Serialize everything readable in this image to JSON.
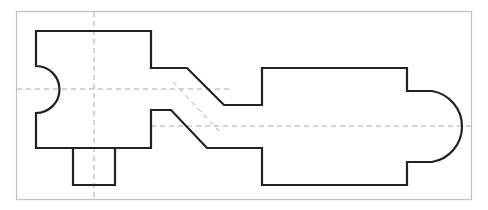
{
  "drawing": {
    "type": "technical-part-outline",
    "description": "Flat part with a left block (semicircular notch on left edge, square tab on bottom), an angled neck, and a right block with a semicircular end",
    "colors": {
      "frame": "#c4c4c4",
      "outline": "#222222",
      "center_lines": "#a8a8a8",
      "background": "#ffffff"
    },
    "features": [
      {
        "name": "left-block",
        "label": "Left block"
      },
      {
        "name": "left-notch",
        "label": "Semicircular notch"
      },
      {
        "name": "bottom-tab",
        "label": "Square tab"
      },
      {
        "name": "angled-neck",
        "label": "Angled neck"
      },
      {
        "name": "right-block",
        "label": "Right block"
      },
      {
        "name": "right-rounded-end",
        "label": "Rounded end"
      }
    ],
    "center_lines": [
      {
        "name": "left-horizontal-centerline"
      },
      {
        "name": "left-vertical-centerline"
      },
      {
        "name": "right-horizontal-centerline"
      },
      {
        "name": "neck-diagonal-centerline"
      }
    ]
  }
}
